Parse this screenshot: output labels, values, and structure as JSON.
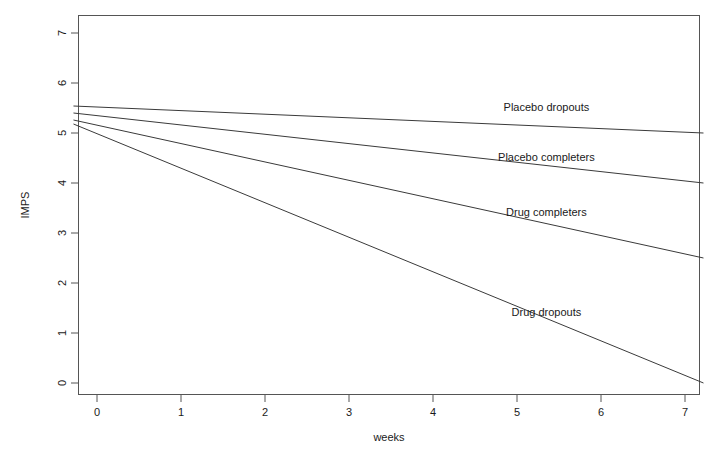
{
  "chart_data": {
    "type": "line",
    "title": "",
    "xlabel": "weeks",
    "ylabel": "IMPS",
    "xlim": [
      -0.3,
      7.35
    ],
    "ylim": [
      -0.25,
      7.3
    ],
    "xticks": [
      0,
      1,
      2,
      3,
      4,
      5,
      6,
      7
    ],
    "xtick_labels": [
      "0",
      "1",
      "2",
      "3",
      "4",
      "5",
      "6",
      "7"
    ],
    "yticks": [
      0,
      1,
      2,
      3,
      4,
      5,
      6,
      7
    ],
    "ytick_labels": [
      "0",
      "1",
      "2",
      "3",
      "4",
      "5",
      "6",
      "7"
    ],
    "grid": false,
    "legend_position": "inline-right",
    "series": [
      {
        "name": "Placebo dropouts",
        "x": [
          -0.28,
          7.22
        ],
        "values": [
          5.54,
          5.0
        ],
        "label_x": 5.35,
        "label_y": 5.45
      },
      {
        "name": "Placebo completers",
        "x": [
          -0.28,
          7.22
        ],
        "values": [
          5.4,
          4.0
        ],
        "label_x": 5.35,
        "label_y": 4.45
      },
      {
        "name": "Drug completers",
        "x": [
          -0.28,
          7.22
        ],
        "values": [
          5.26,
          2.5
        ],
        "label_x": 5.35,
        "label_y": 3.35
      },
      {
        "name": "Drug dropouts",
        "x": [
          -0.28,
          7.22
        ],
        "values": [
          5.18,
          0.0
        ],
        "label_x": 5.35,
        "label_y": 1.35
      }
    ]
  }
}
